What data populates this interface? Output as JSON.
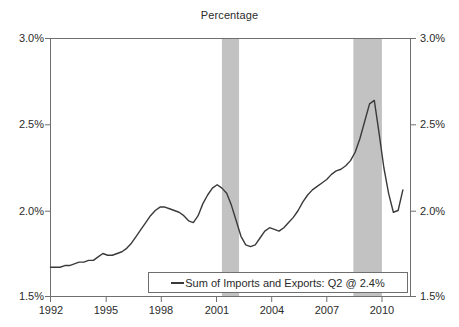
{
  "chart_data": {
    "type": "line",
    "title": "Percentage",
    "xlabel": "",
    "ylabel": "",
    "ylim": [
      1.5,
      3.0
    ],
    "xlim": [
      1992.0,
      2010.9
    ],
    "grid": false,
    "legend_position": "bottom-center",
    "y_ticks": [
      "1.5%",
      "2.0%",
      "2.5%",
      "3.0%"
    ],
    "y_tick_values": [
      1.5,
      2.0,
      2.5,
      3.0
    ],
    "x_ticks": [
      "1992",
      "1995",
      "1998",
      "2001",
      "2004",
      "2007",
      "2010"
    ],
    "x_tick_values": [
      1992,
      1995,
      1998,
      2001,
      2004,
      2007,
      2010
    ],
    "dual_axis": true,
    "right_axis_ticks": [
      "1.5%",
      "2.0%",
      "2.5%",
      "3.0%"
    ],
    "line_color": "#3a3a3a",
    "band_color": "#c2c2c2",
    "shaded_bands": [
      {
        "label": "recession",
        "start": 2001.0,
        "end": 2001.9
      },
      {
        "label": "recession",
        "start": 2007.9,
        "end": 2009.4
      }
    ],
    "series": [
      {
        "name": "Sum of Imports and Exports: Q2 @ 2.4%",
        "legend_label": "Sum of Imports and Exports: Q2 @ 2.4%",
        "last_value": 2.4,
        "x": [
          1992.0,
          1992.25,
          1992.5,
          1992.75,
          1993.0,
          1993.25,
          1993.5,
          1993.75,
          1994.0,
          1994.25,
          1994.5,
          1994.75,
          1995.0,
          1995.25,
          1995.5,
          1995.75,
          1996.0,
          1996.25,
          1996.5,
          1996.75,
          1997.0,
          1997.25,
          1997.5,
          1997.75,
          1998.0,
          1998.25,
          1998.5,
          1998.75,
          1999.0,
          1999.25,
          1999.5,
          1999.75,
          2000.0,
          2000.25,
          2000.5,
          2000.75,
          2001.0,
          2001.25,
          2001.5,
          2001.75,
          2002.0,
          2002.25,
          2002.5,
          2002.75,
          2003.0,
          2003.25,
          2003.5,
          2003.75,
          2004.0,
          2004.25,
          2004.5,
          2004.75,
          2005.0,
          2005.25,
          2005.5,
          2005.75,
          2006.0,
          2006.25,
          2006.5,
          2006.75,
          2007.0,
          2007.25,
          2007.5,
          2007.75,
          2008.0,
          2008.25,
          2008.5,
          2008.75,
          2009.0,
          2009.25,
          2009.5,
          2009.75,
          2010.0,
          2010.25,
          2010.5
        ],
        "values": [
          1.67,
          1.67,
          1.67,
          1.68,
          1.68,
          1.69,
          1.7,
          1.7,
          1.71,
          1.71,
          1.73,
          1.75,
          1.74,
          1.74,
          1.75,
          1.76,
          1.78,
          1.81,
          1.85,
          1.89,
          1.93,
          1.97,
          2.0,
          2.02,
          2.02,
          2.01,
          2.0,
          1.99,
          1.97,
          1.94,
          1.93,
          1.97,
          2.04,
          2.09,
          2.13,
          2.15,
          2.13,
          2.1,
          2.03,
          1.94,
          1.85,
          1.8,
          1.79,
          1.8,
          1.84,
          1.88,
          1.9,
          1.89,
          1.88,
          1.9,
          1.93,
          1.96,
          2.0,
          2.05,
          2.09,
          2.12,
          2.14,
          2.16,
          2.18,
          2.21,
          2.23,
          2.24,
          2.26,
          2.29,
          2.34,
          2.42,
          2.52,
          2.62,
          2.64,
          2.45,
          2.25,
          2.1,
          1.99,
          2.0,
          2.12
        ]
      }
    ],
    "annotations": []
  },
  "legend": {
    "label": "Sum of Imports and Exports: Q2 @ 2.4%",
    "marker": "line-swatch"
  }
}
